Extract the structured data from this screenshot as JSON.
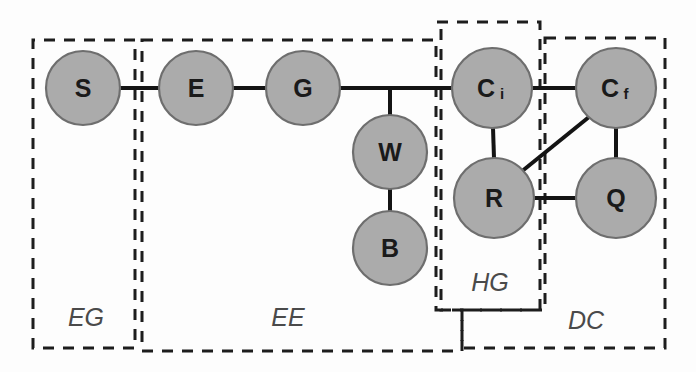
{
  "figure": {
    "type": "node-link-diagram",
    "width": 696,
    "height": 372,
    "background_color": "#fdfdfd",
    "node_fill_color": "#ababab",
    "node_stroke_color": "#6e6e6e",
    "edge_color": "#141414",
    "group_stroke_color": "#1d1d1d",
    "group_label_color": "#4a4a4a"
  },
  "nodes": [
    {
      "id": "S",
      "label": "S",
      "sub": "",
      "cx": 83,
      "cy": 88,
      "r": 37
    },
    {
      "id": "E",
      "label": "E",
      "sub": "",
      "cx": 196,
      "cy": 88,
      "r": 37
    },
    {
      "id": "G",
      "label": "G",
      "sub": "",
      "cx": 303,
      "cy": 88,
      "r": 37
    },
    {
      "id": "W",
      "label": "W",
      "sub": "",
      "cx": 390,
      "cy": 152,
      "r": 37
    },
    {
      "id": "B",
      "label": "B",
      "sub": "",
      "cx": 390,
      "cy": 248,
      "r": 37
    },
    {
      "id": "Ci",
      "label": "C",
      "sub": "i",
      "cx": 492,
      "cy": 88,
      "r": 40
    },
    {
      "id": "Cf",
      "label": "C",
      "sub": "f",
      "cx": 616,
      "cy": 88,
      "r": 40
    },
    {
      "id": "R",
      "label": "R",
      "sub": "",
      "cx": 494,
      "cy": 198,
      "r": 40
    },
    {
      "id": "Q",
      "label": "Q",
      "sub": "",
      "cx": 616,
      "cy": 198,
      "r": 40
    }
  ],
  "edges": [
    {
      "id": "S-E",
      "from": "S",
      "to": "E",
      "x1": 120,
      "y1": 88,
      "x2": 159,
      "y2": 88
    },
    {
      "id": "E-G",
      "from": "E",
      "to": "G",
      "x1": 233,
      "y1": 88,
      "x2": 266,
      "y2": 88
    },
    {
      "id": "G-Ci",
      "from": "G",
      "to": "Ci",
      "x1": 340,
      "y1": 88,
      "x2": 452,
      "y2": 88
    },
    {
      "id": "G-W",
      "from": "G",
      "to": "W",
      "x1": 390,
      "y1": 88,
      "x2": 390,
      "y2": 115
    },
    {
      "id": "W-B",
      "from": "W",
      "to": "B",
      "x1": 390,
      "y1": 189,
      "x2": 390,
      "y2": 211
    },
    {
      "id": "Ci-Cf",
      "from": "Ci",
      "to": "Cf",
      "x1": 532,
      "y1": 88,
      "x2": 576,
      "y2": 88
    },
    {
      "id": "Ci-R",
      "from": "Ci",
      "to": "R",
      "x1": 493,
      "y1": 128,
      "x2": 494,
      "y2": 158
    },
    {
      "id": "Cf-Q",
      "from": "Cf",
      "to": "Q",
      "x1": 616,
      "y1": 128,
      "x2": 616,
      "y2": 158
    },
    {
      "id": "Cf-R",
      "from": "Cf",
      "to": "R",
      "x1": 589,
      "y1": 117,
      "x2": 521,
      "y2": 172
    },
    {
      "id": "R-Q",
      "from": "R",
      "to": "Q",
      "x1": 534,
      "y1": 198,
      "x2": 576,
      "y2": 198
    }
  ],
  "groups": [
    {
      "id": "EG",
      "label": "EG",
      "path": "M 135 40 L 33 40 L 33 348 L 135 348 L 135 40 Z",
      "label_x": 86,
      "label_y": 317
    },
    {
      "id": "EE",
      "label": "EE",
      "path": "M 142 40 L 436 40 L 436 310 L 462 310 L 462 351 L 142 351 L 142 40 Z",
      "label_x": 288,
      "label_y": 317
    },
    {
      "id": "HG",
      "label": "HG",
      "path": "M 437 22 L 540 22 L 540 310 L 441 310 L 441 22 Z",
      "label_x": 490,
      "label_y": 282
    },
    {
      "id": "DC",
      "label": "DC",
      "path": "M 545 38 L 665 38 L 665 348 L 462 348 L 462 310 L 545 310 L 545 38 Z",
      "label_x": 586,
      "label_y": 320
    }
  ]
}
